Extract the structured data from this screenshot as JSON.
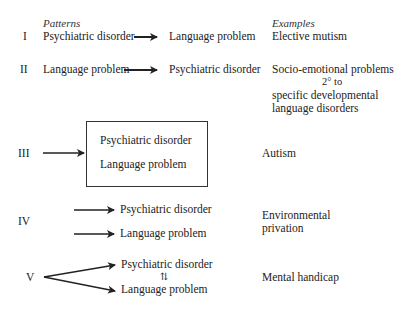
{
  "headers": {
    "patterns": "Patterns",
    "examples": "Examples"
  },
  "rows": [
    {
      "numeral": "I",
      "left": "Psychiatric disorder",
      "right": "Language problem",
      "example": "Elective mutism"
    },
    {
      "numeral": "II",
      "left": "Language problem",
      "right": "Psychiatric disorder",
      "example_lines": [
        "Socio-emotional problems",
        "2° to",
        "specific developmental",
        "language disorders"
      ]
    },
    {
      "numeral": "III",
      "box_lines": [
        "Psychiatric disorder",
        "Language problem"
      ],
      "example": "Autism"
    },
    {
      "numeral": "IV",
      "targets": [
        "Psychiatric disorder",
        "Language problem"
      ],
      "example_lines": [
        "Environmental",
        "privation"
      ]
    },
    {
      "numeral": "V",
      "targets": [
        "Psychiatric disorder",
        "Language problem"
      ],
      "link_symbol": "⇅",
      "example": "Mental handicap"
    }
  ]
}
